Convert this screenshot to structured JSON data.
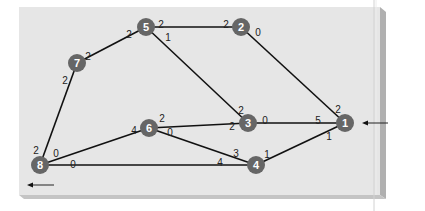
{
  "diagram": {
    "type": "weighted-network-graph",
    "colors": {
      "panel": "#e6e6e6",
      "panel_shadow": "#b4b4b4",
      "node_fill": "#666666",
      "node_label": "#ffffff",
      "edge": "#111111",
      "weight_label": "#222222"
    },
    "nodes": [
      {
        "id": "1",
        "label": "1",
        "x": 345,
        "y": 123
      },
      {
        "id": "2",
        "label": "2",
        "x": 241,
        "y": 27
      },
      {
        "id": "3",
        "label": "3",
        "x": 248,
        "y": 123
      },
      {
        "id": "4",
        "label": "4",
        "x": 256,
        "y": 165
      },
      {
        "id": "5",
        "label": "5",
        "x": 146,
        "y": 27
      },
      {
        "id": "6",
        "label": "6",
        "x": 149,
        "y": 128
      },
      {
        "id": "7",
        "label": "7",
        "x": 77,
        "y": 63
      },
      {
        "id": "8",
        "label": "8",
        "x": 40,
        "y": 165
      }
    ],
    "edges": [
      {
        "from": "5",
        "to": "2",
        "label_from": "2",
        "label_to": "2"
      },
      {
        "from": "2",
        "to": "1",
        "label_from": "0",
        "label_to": "2"
      },
      {
        "from": "7",
        "to": "5",
        "label_from": "2",
        "label_to": "2"
      },
      {
        "from": "5",
        "to": "3",
        "label_from": "1",
        "label_to": "2"
      },
      {
        "from": "3",
        "to": "1",
        "label_from": "0",
        "label_to": "5"
      },
      {
        "from": "8",
        "to": "7",
        "label_from": "2",
        "label_to": "2"
      },
      {
        "from": "8",
        "to": "6",
        "label_from": "0",
        "label_to": "4"
      },
      {
        "from": "6",
        "to": "3",
        "label_from": "2",
        "label_to": "2"
      },
      {
        "from": "6",
        "to": "4",
        "label_from": "0",
        "label_to": "3"
      },
      {
        "from": "8",
        "to": "4",
        "label_from": "0",
        "label_to": "4"
      },
      {
        "from": "4",
        "to": "1",
        "label_from": "1",
        "label_to": "1"
      }
    ],
    "weight_labels": [
      {
        "edge": "5-2",
        "end": "5",
        "text": "2",
        "x": 161,
        "y": 24
      },
      {
        "edge": "5-2",
        "end": "2",
        "text": "2",
        "x": 226,
        "y": 24
      },
      {
        "edge": "2-1",
        "end": "2",
        "text": "0",
        "x": 258,
        "y": 32
      },
      {
        "edge": "2-1",
        "end": "1",
        "text": "2",
        "x": 338,
        "y": 109
      },
      {
        "edge": "7-5",
        "end": "7",
        "text": "2",
        "x": 88,
        "y": 56
      },
      {
        "edge": "7-5",
        "end": "5",
        "text": "2",
        "x": 129,
        "y": 34
      },
      {
        "edge": "5-3",
        "end": "5",
        "text": "1",
        "x": 168,
        "y": 37
      },
      {
        "edge": "5-3",
        "end": "3",
        "text": "2",
        "x": 241,
        "y": 110
      },
      {
        "edge": "3-1",
        "end": "3",
        "text": "0",
        "x": 265,
        "y": 120
      },
      {
        "edge": "3-1",
        "end": "1",
        "text": "5",
        "x": 318,
        "y": 120
      },
      {
        "edge": "8-7",
        "end": "7",
        "text": "2",
        "x": 65,
        "y": 80
      },
      {
        "edge": "8-7",
        "end": "8",
        "text": "2",
        "x": 36,
        "y": 150
      },
      {
        "edge": "8-6",
        "end": "8",
        "text": "0",
        "x": 56,
        "y": 153
      },
      {
        "edge": "8-6",
        "end": "6",
        "text": "4",
        "x": 134,
        "y": 130
      },
      {
        "edge": "6-3",
        "end": "6",
        "text": "2",
        "x": 162,
        "y": 118
      },
      {
        "edge": "6-3",
        "end": "3",
        "text": "2",
        "x": 232,
        "y": 126
      },
      {
        "edge": "6-4",
        "end": "6",
        "text": "0",
        "x": 170,
        "y": 132
      },
      {
        "edge": "6-4",
        "end": "4",
        "text": "3",
        "x": 236,
        "y": 153
      },
      {
        "edge": "8-4",
        "end": "8",
        "text": "0",
        "x": 73,
        "y": 164
      },
      {
        "edge": "8-4",
        "end": "4",
        "text": "4",
        "x": 220,
        "y": 162
      },
      {
        "edge": "4-1",
        "end": "4",
        "text": "1",
        "x": 267,
        "y": 154
      },
      {
        "edge": "4-1",
        "end": "1",
        "text": "1",
        "x": 329,
        "y": 136
      }
    ],
    "arrows": [
      {
        "name": "inbound-arrow-node-1",
        "direction": "left",
        "x1": 388,
        "y1": 123,
        "x2": 362,
        "y2": 123
      },
      {
        "name": "outbound-arrow-node-8",
        "direction": "left",
        "x1": 54,
        "y1": 185,
        "x2": 27,
        "y2": 185
      }
    ]
  }
}
